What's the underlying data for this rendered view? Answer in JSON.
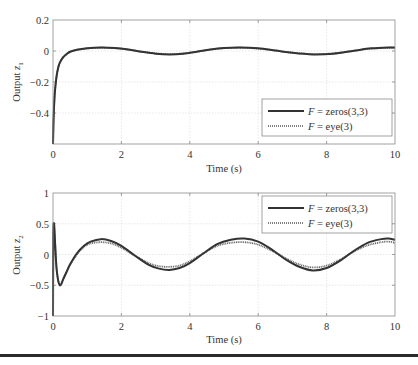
{
  "chart_data": [
    {
      "type": "line",
      "title": "",
      "xlabel": "Time (s)",
      "ylabel": "Output z1",
      "ylabel_main": "Output ",
      "ylabel_sub": "z",
      "ylabel_index": "1",
      "xlim": [
        0,
        10
      ],
      "ylim": [
        -0.6,
        0.2
      ],
      "xticks": [
        0,
        2,
        4,
        6,
        8,
        10
      ],
      "xtick_labels": [
        "0",
        "2",
        "4",
        "6",
        "8",
        "10"
      ],
      "yticks": [
        0.2,
        0,
        -0.2,
        -0.4
      ],
      "ytick_labels": [
        "0.2",
        "0",
        "−0.2",
        "−0.4"
      ],
      "grid": true,
      "legend_position": "lower right",
      "legend": [
        "F = zeros(3,3)",
        "F = eye(3)"
      ],
      "series": [
        {
          "name": "F = zeros(3,3)",
          "style": "solid",
          "x": [
            0,
            0.02,
            0.05,
            0.1,
            0.15,
            0.2,
            0.3,
            0.4,
            0.5,
            0.7,
            1.0,
            1.4,
            1.8,
            2.2,
            2.6,
            3.0,
            3.4,
            3.8,
            4.2,
            4.6,
            5.0,
            5.5,
            6.0,
            6.5,
            7.0,
            7.6,
            8.2,
            8.8,
            9.3,
            9.8,
            10
          ],
          "y": [
            -0.6,
            -0.42,
            -0.28,
            -0.17,
            -0.11,
            -0.075,
            -0.04,
            -0.02,
            -0.005,
            0.008,
            0.018,
            0.023,
            0.02,
            0.01,
            -0.005,
            -0.017,
            -0.022,
            -0.018,
            -0.005,
            0.01,
            0.02,
            0.023,
            0.017,
            0.003,
            -0.012,
            -0.022,
            -0.017,
            0.002,
            0.017,
            0.023,
            0.022
          ]
        },
        {
          "name": "F = eye(3)",
          "style": "dotted",
          "x": [
            0,
            0.02,
            0.05,
            0.1,
            0.15,
            0.2,
            0.3,
            0.4,
            0.5,
            0.7,
            1.0,
            1.4,
            1.8,
            2.2,
            2.6,
            3.0,
            3.4,
            3.8,
            4.2,
            4.6,
            5.0,
            5.5,
            6.0,
            6.5,
            7.0,
            7.6,
            8.2,
            8.8,
            9.3,
            9.8,
            10
          ],
          "y": [
            -0.6,
            -0.42,
            -0.28,
            -0.17,
            -0.11,
            -0.075,
            -0.04,
            -0.02,
            -0.005,
            0.008,
            0.017,
            0.021,
            0.018,
            0.009,
            -0.005,
            -0.015,
            -0.02,
            -0.016,
            -0.005,
            0.009,
            0.018,
            0.021,
            0.015,
            0.003,
            -0.011,
            -0.02,
            -0.015,
            0.002,
            0.015,
            0.021,
            0.02
          ]
        }
      ]
    },
    {
      "type": "line",
      "title": "",
      "xlabel": "Time (s)",
      "ylabel": "Output z2",
      "ylabel_main": "Output ",
      "ylabel_sub": "z",
      "ylabel_index": "2",
      "xlim": [
        0,
        10
      ],
      "ylim": [
        -1,
        1
      ],
      "xticks": [
        0,
        2,
        4,
        6,
        8,
        10
      ],
      "xtick_labels": [
        "0",
        "2",
        "4",
        "6",
        "8",
        "10"
      ],
      "yticks": [
        1,
        0.5,
        0,
        -0.5,
        -1
      ],
      "ytick_labels": [
        "1",
        "0.5",
        "0",
        "−0.5",
        "−1"
      ],
      "grid": true,
      "legend_position": "upper right",
      "legend": [
        "F = zeros(3,3)",
        "F = eye(3)"
      ],
      "series": [
        {
          "name": "F = zeros(3,3)",
          "style": "solid",
          "x": [
            0,
            0.01,
            0.03,
            0.06,
            0.1,
            0.15,
            0.2,
            0.25,
            0.3,
            0.4,
            0.5,
            0.7,
            0.9,
            1.1,
            1.4,
            1.7,
            2.0,
            2.4,
            2.8,
            3.1,
            3.4,
            3.7,
            4.0,
            4.4,
            4.8,
            5.2,
            5.6,
            6.0,
            6.4,
            6.8,
            7.2,
            7.6,
            8.0,
            8.4,
            8.8,
            9.2,
            9.6,
            9.8,
            10
          ],
          "y": [
            -1,
            0.3,
            0.5,
            0.2,
            -0.2,
            -0.42,
            -0.5,
            -0.47,
            -0.4,
            -0.28,
            -0.16,
            0.02,
            0.14,
            0.21,
            0.25,
            0.22,
            0.14,
            -0.02,
            -0.17,
            -0.23,
            -0.25,
            -0.22,
            -0.14,
            0.02,
            0.17,
            0.24,
            0.26,
            0.21,
            0.08,
            -0.08,
            -0.2,
            -0.26,
            -0.22,
            -0.1,
            0.06,
            0.19,
            0.25,
            0.26,
            0.24
          ]
        },
        {
          "name": "F = eye(3)",
          "style": "dotted",
          "x": [
            0,
            0.01,
            0.03,
            0.06,
            0.1,
            0.15,
            0.2,
            0.25,
            0.3,
            0.4,
            0.5,
            0.7,
            0.9,
            1.1,
            1.4,
            1.7,
            2.0,
            2.4,
            2.8,
            3.1,
            3.4,
            3.7,
            4.0,
            4.4,
            4.8,
            5.2,
            5.6,
            6.0,
            6.4,
            6.8,
            7.2,
            7.6,
            8.0,
            8.4,
            8.8,
            9.2,
            9.6,
            9.8,
            10
          ],
          "y": [
            -1,
            0.3,
            0.5,
            0.2,
            -0.2,
            -0.42,
            -0.5,
            -0.47,
            -0.4,
            -0.28,
            -0.17,
            0.0,
            0.12,
            0.18,
            0.2,
            0.18,
            0.11,
            -0.02,
            -0.14,
            -0.19,
            -0.2,
            -0.18,
            -0.11,
            0.02,
            0.14,
            0.19,
            0.2,
            0.16,
            0.06,
            -0.06,
            -0.16,
            -0.21,
            -0.18,
            -0.08,
            0.05,
            0.15,
            0.2,
            0.21,
            0.19
          ]
        }
      ]
    }
  ],
  "colors": {
    "line": "#333333",
    "frame": "#8a8a8a",
    "grid": "#d8d8d8",
    "text": "#333333"
  }
}
